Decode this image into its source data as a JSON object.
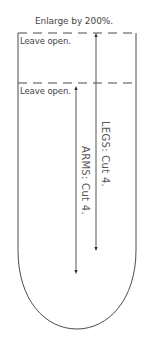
{
  "diagram": {
    "title": "Enlarge by 200%.",
    "pieces": [
      {
        "name": "legs",
        "label": "LEGS:  Cut 4.",
        "opening_label": "Leave open.",
        "grainline": {
          "x": 96,
          "y_start": 33,
          "y_end": 250
        }
      },
      {
        "name": "arms",
        "label": "ARMS:  Cut 4.",
        "opening_label": "Leave open.",
        "grainline": {
          "x": 76,
          "y_start": 86,
          "y_end": 273
        }
      }
    ],
    "outline": {
      "left_x": 18,
      "right_x": 136,
      "top_y": 33,
      "arms_top_y": 83,
      "bottom_y": 329,
      "style": "solid sides, dashed open tops, rounded bottom"
    },
    "colors": {
      "line": "#4a4a4a",
      "text": "#444444",
      "background": "#ffffff"
    }
  }
}
